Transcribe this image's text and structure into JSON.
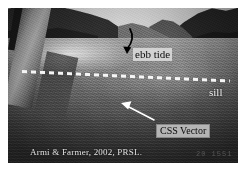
{
  "figure": {
    "kind": "annotated-photograph",
    "scene_description": "Aerial oblique photograph of a fjord looking down the channel, taken from an aircraft; a strut is visible at the left edge.",
    "frame_color": "#ffffff",
    "photo": {
      "sky_color": "#cfcfcf",
      "ridge_color": "#2e2e2e",
      "water_color": "#5e5e5e",
      "glare_color": "#ffffff"
    }
  },
  "annotations": {
    "ebb_tide": {
      "label": "ebb tide",
      "text_color": "#0a0a0a",
      "box_color": "#e2e2e2",
      "arrow_color": "#000000",
      "arrow_shape": "curved",
      "arrow_direction": "down-left"
    },
    "sill": {
      "label": "sill",
      "text_color": "#f2f2f2",
      "line_style": "dashed",
      "line_color": "#f5f5f5"
    },
    "css_vector": {
      "label": "CSS Vector",
      "text_color": "#0a0a0a",
      "box_color": "#c6c6c6",
      "arrow_color": "#ffffff",
      "arrow_shape": "straight",
      "arrow_direction": "up-left"
    }
  },
  "credit": {
    "text": "Armi & Farmer, 2002, PRSL.",
    "color": "#e4e4e4"
  },
  "timestamp": {
    "text": "20  1551",
    "color": "#565656"
  }
}
